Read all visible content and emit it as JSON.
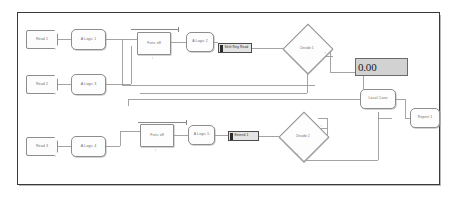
{
  "app": {
    "canvas_label": "block-diagram-canvas",
    "background_color": "#ffffff",
    "canvas_border_color": "#3a3a3a",
    "node_border_color": "#8d8d8d",
    "node_fill_color": "#fdfdfd",
    "wire_color": "#909090",
    "selected_fill_color": "#e4e4e4",
    "readout_fill_color": "#d2d2d2"
  },
  "readout": {
    "name": "numeric-display",
    "value": "0.00"
  },
  "nodes": {
    "input_1": {
      "label": "Read 1",
      "type": "flag"
    },
    "input_2": {
      "label": "Read 2",
      "type": "flag"
    },
    "input_3": {
      "label": "Read 3",
      "type": "flag"
    },
    "proc_1": {
      "label": "A Logic 1",
      "type": "round"
    },
    "proc_2": {
      "label": "A Logic 3",
      "type": "round"
    },
    "proc_3": {
      "label": "A Logic 4",
      "type": "round"
    },
    "proc_4": {
      "label": "A Logic 2",
      "type": "round"
    },
    "proc_5": {
      "label": "A Logic 5",
      "type": "round"
    },
    "rect_1": {
      "label": "Func off",
      "type": "rect"
    },
    "rect_2": {
      "label": "Func off",
      "type": "rect"
    },
    "sel_1": {
      "label": "Shift Reg Read",
      "type": "selected"
    },
    "sel_2": {
      "label": "Extend 1",
      "type": "selected"
    },
    "merge": {
      "label": "Local Case",
      "type": "round"
    },
    "output_1": {
      "label": "Report 1",
      "type": "round"
    }
  },
  "decisions": {
    "decision_1": {
      "label": "Decide 1"
    },
    "decision_2": {
      "label": "Decide 2"
    }
  },
  "port_ticks": {
    "t1": "i",
    "t2": "i",
    "t3": "i",
    "t4": "i",
    "t5": "i",
    "t6": "i",
    "t7": "i",
    "t8": "i"
  }
}
